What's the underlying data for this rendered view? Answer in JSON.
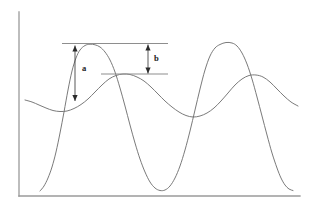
{
  "figure": {
    "background_color": "#ffffff",
    "width": 311,
    "height": 211
  },
  "axes": {
    "axis_color": "#9a9a9a",
    "y_axis": {
      "name": "y-axis",
      "x": 19,
      "y_top": 12,
      "y_bottom": 196
    },
    "x_axis": {
      "name": "x-axis",
      "y": 196,
      "x_left": 19,
      "x_right": 300
    },
    "x_tick_labels": [],
    "y_tick_labels": [],
    "grid": false
  },
  "annotations": {
    "reference_lines": [
      {
        "id": "upper-reference-line",
        "label": "",
        "y": 43.5,
        "x_start": 62,
        "x_end": 168,
        "color": "#8e8e8e"
      },
      {
        "id": "lower-reference-line",
        "label": "",
        "y": 74.0,
        "x_start": 101,
        "x_end": 168,
        "color": "#8e8e8e"
      }
    ],
    "measurements": [
      {
        "id": "measurement-a",
        "label": "a",
        "x": 75,
        "y_top": 45.5,
        "y_bottom": 101,
        "label_x": 82,
        "label_y": 69,
        "arrow": "double-headed",
        "color": "#2b2b2b"
      },
      {
        "id": "measurement-b",
        "label": "b",
        "x": 148,
        "y_top": 44.5,
        "y_bottom": 73.5,
        "label_x": 154,
        "label_y": 59,
        "arrow": "double-headed",
        "color": "#2b2b2b"
      }
    ]
  },
  "chart_data": {
    "type": "line",
    "title": "",
    "xlabel": "",
    "ylabel": "",
    "xlim": [
      19,
      300
    ],
    "ylim": [
      196,
      12
    ],
    "grid": false,
    "legend": "none",
    "series": [
      {
        "name": "sharp-peak-curve",
        "description": "High-amplitude narrow-peaked oscillation",
        "color": "#6b6b6b",
        "stroke_width": 0.9,
        "points": [
          [
            40,
            191
          ],
          [
            44,
            186
          ],
          [
            48,
            178
          ],
          [
            52,
            167
          ],
          [
            56,
            152
          ],
          [
            60,
            133
          ],
          [
            64,
            112
          ],
          [
            68,
            90
          ],
          [
            72,
            71
          ],
          [
            76,
            58
          ],
          [
            80,
            50
          ],
          [
            85,
            45.5
          ],
          [
            90,
            44.2
          ],
          [
            95,
            44.8
          ],
          [
            100,
            47
          ],
          [
            105,
            52
          ],
          [
            110,
            60
          ],
          [
            115,
            72
          ],
          [
            120,
            88
          ],
          [
            125,
            106
          ],
          [
            130,
            125
          ],
          [
            135,
            143
          ],
          [
            140,
            159
          ],
          [
            145,
            172
          ],
          [
            150,
            182
          ],
          [
            155,
            188
          ],
          [
            160,
            190.5
          ],
          [
            165,
            190
          ],
          [
            170,
            186
          ],
          [
            175,
            178
          ],
          [
            180,
            166
          ],
          [
            185,
            150
          ],
          [
            190,
            131
          ],
          [
            195,
            110
          ],
          [
            200,
            89
          ],
          [
            205,
            70
          ],
          [
            210,
            56
          ],
          [
            215,
            48
          ],
          [
            220,
            44.5
          ],
          [
            226,
            42.5
          ],
          [
            232,
            43
          ],
          [
            237,
            46
          ],
          [
            242,
            53
          ],
          [
            247,
            64
          ],
          [
            252,
            79
          ],
          [
            257,
            97
          ],
          [
            262,
            116
          ],
          [
            267,
            135
          ],
          [
            272,
            153
          ],
          [
            277,
            168
          ],
          [
            281,
            178
          ],
          [
            285,
            185
          ],
          [
            289,
            189
          ],
          [
            293,
            190.5
          ]
        ]
      },
      {
        "name": "smooth-wave-curve",
        "description": "Low-amplitude broad sinusoidal oscillation",
        "color": "#6b6b6b",
        "stroke_width": 0.9,
        "points": [
          [
            25,
            100
          ],
          [
            32,
            102
          ],
          [
            39,
            105
          ],
          [
            46,
            108
          ],
          [
            53,
            110.5
          ],
          [
            60,
            111.5
          ],
          [
            67,
            111
          ],
          [
            74,
            108.5
          ],
          [
            81,
            104.5
          ],
          [
            88,
            99
          ],
          [
            95,
            92
          ],
          [
            102,
            85
          ],
          [
            109,
            79
          ],
          [
            116,
            75.5
          ],
          [
            123,
            74
          ],
          [
            130,
            74.5
          ],
          [
            137,
            77
          ],
          [
            144,
            81
          ],
          [
            151,
            87
          ],
          [
            158,
            94
          ],
          [
            165,
            101
          ],
          [
            172,
            107
          ],
          [
            179,
            112
          ],
          [
            186,
            115.5
          ],
          [
            193,
            117
          ],
          [
            200,
            116
          ],
          [
            207,
            113
          ],
          [
            214,
            108
          ],
          [
            221,
            101
          ],
          [
            228,
            93
          ],
          [
            235,
            85
          ],
          [
            242,
            79
          ],
          [
            249,
            75.5
          ],
          [
            256,
            75
          ],
          [
            263,
            77
          ],
          [
            270,
            82
          ],
          [
            277,
            89
          ],
          [
            284,
            96
          ],
          [
            291,
            102
          ],
          [
            298,
            106
          ]
        ]
      }
    ]
  }
}
